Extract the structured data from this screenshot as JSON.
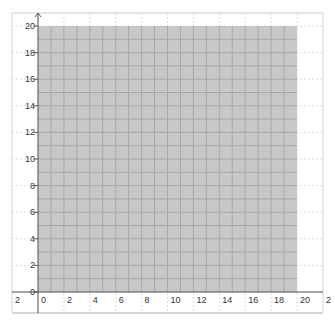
{
  "chart_data": {
    "type": "area",
    "title": "",
    "xlabel": "",
    "ylabel": "",
    "xlim": [
      -3,
      22
    ],
    "ylim": [
      -1.6,
      20.9
    ],
    "grid": true,
    "region": {
      "description": "Shaded feasible region",
      "x_range": [
        0,
        20
      ],
      "y_range": [
        0,
        20
      ],
      "fill_color": "#c8c8c8"
    },
    "x_ticks": [
      {
        "value": -2,
        "label": "2"
      },
      {
        "value": 0,
        "label": "0"
      },
      {
        "value": 2,
        "label": "2"
      },
      {
        "value": 4,
        "label": "4"
      },
      {
        "value": 6,
        "label": "6"
      },
      {
        "value": 8,
        "label": "8"
      },
      {
        "value": 10,
        "label": "10"
      },
      {
        "value": 12,
        "label": "12"
      },
      {
        "value": 14,
        "label": "14"
      },
      {
        "value": 16,
        "label": "16"
      },
      {
        "value": 18,
        "label": "18"
      },
      {
        "value": 20,
        "label": "20"
      },
      {
        "value": 22,
        "label": "2"
      }
    ],
    "y_ticks": [
      {
        "value": 0,
        "label": "0"
      },
      {
        "value": 2,
        "label": "2"
      },
      {
        "value": 4,
        "label": "4"
      },
      {
        "value": 6,
        "label": "6"
      },
      {
        "value": 8,
        "label": "8"
      },
      {
        "value": 10,
        "label": "10"
      },
      {
        "value": 12,
        "label": "12"
      },
      {
        "value": 14,
        "label": "14"
      },
      {
        "value": 16,
        "label": "16"
      },
      {
        "value": 18,
        "label": "18"
      },
      {
        "value": 20,
        "label": "20"
      }
    ],
    "colors": {
      "region": "#c8c8c8",
      "minor_grid": "#a8a8a8",
      "outer_grid": "#dddddd",
      "axis": "#555555"
    }
  }
}
